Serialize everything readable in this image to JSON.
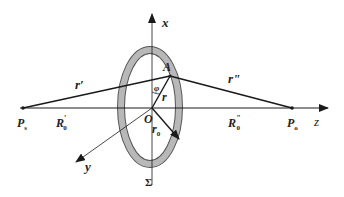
{
  "diagram": {
    "type": "optics-geometry",
    "colors": {
      "line": "#1a1a1a",
      "ring": "#b0b0b0",
      "ring_edge": "#555555"
    },
    "labels": {
      "x_axis": "x",
      "y_axis": "y",
      "z_axis": "z",
      "point_A": "A",
      "origin": "O",
      "angle": "φ",
      "r_prime": "r′",
      "r_double_prime": "r\"",
      "r": "r",
      "r0": "r",
      "r0_sub": "0",
      "Ps": "P",
      "Ps_sub": "s",
      "Po": "P",
      "Po_sub": "o",
      "R0_prime": "R",
      "R0_prime_sub": "0",
      "R0_prime_sup": "′",
      "R0_double_prime": "R",
      "R0_double_prime_sub": "0",
      "R0_double_prime_sup": "\"",
      "surface": "Σ"
    }
  }
}
